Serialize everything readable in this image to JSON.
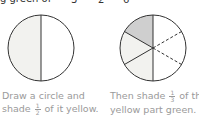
{
  "header": {
    "cropped_text": "g green of",
    "denominators": [
      "3",
      "2",
      "6"
    ]
  },
  "figures": [
    {
      "name": "half-circle",
      "description": "circle divided into 2 halves, left half shaded yellow",
      "colors": {
        "yellow": "#f2f2ef",
        "outline": "#333333"
      }
    },
    {
      "name": "sixths-circle",
      "description": "circle divided into sixths; left half yellow, top-left sixth green; right half dashed lines",
      "colors": {
        "yellow": "#f2f2ef",
        "green": "#cfcfcf",
        "outline": "#333333"
      }
    }
  ],
  "captions": [
    {
      "line1": "Draw a circle and",
      "line2_pre": "shade",
      "frac_num": "1",
      "frac_den": "2",
      "line2_post": "of it yellow."
    },
    {
      "line1_pre": "Then shade",
      "frac_num": "1",
      "frac_den": "3",
      "line1_post": "of the",
      "line2": "yellow part green."
    }
  ]
}
